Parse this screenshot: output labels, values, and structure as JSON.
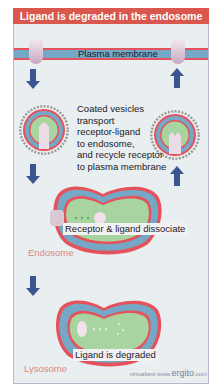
{
  "title": "Ligand is degraded in the endosome",
  "labels": {
    "plasma_membrane": "Plasma membrane",
    "coated_vesicles": "Coated vesicles\ntransport\nreceptor-ligand\nto endosome,\nand recycle receptor\nto plasma membrane",
    "receptor_ligand_dissociate": "Receptor & ligand dissociate",
    "endosome": "Endosome",
    "ligand_degraded": "Ligand is degraded",
    "lysosome": "Lysosome"
  },
  "credit": {
    "prefix": "virtualtext  www.",
    "brand": "ergito",
    "suffix": ".com"
  },
  "colors": {
    "title_bg": "#d9574d",
    "membrane_red": "#e5525c",
    "membrane_blue": "#74a8c6",
    "lumen_green": "#a8d4a0",
    "arrow_blue": "#3a5590",
    "background": "#e9eef0"
  }
}
